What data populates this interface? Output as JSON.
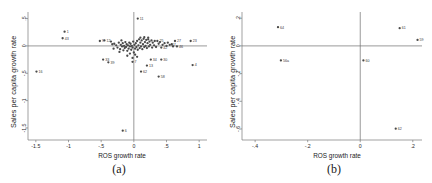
{
  "figure": {
    "panels": [
      {
        "id": "a",
        "caption": "(a)",
        "xlabel": "ROS growth rate",
        "ylabel": "Sales per capita growth rate"
      },
      {
        "id": "b",
        "caption": "(b)",
        "xlabel": "ROS growth rate",
        "ylabel": "Sales per capita growth rate"
      }
    ]
  },
  "chart_data": [
    {
      "type": "scatter",
      "panel": "a",
      "title": "(a)",
      "xlabel": "ROS growth rate",
      "ylabel": "Sales per capita growth rate",
      "xlim": [
        -1.62,
        1.12
      ],
      "ylim": [
        -1.72,
        0.62
      ],
      "xticks": [
        -1.5,
        -1,
        -0.5,
        0,
        0.5,
        1
      ],
      "xticklabels": [
        "-1.5",
        "-1",
        "-.5",
        "0",
        ".5",
        "1"
      ],
      "yticks": [
        0.5,
        0,
        -0.5,
        -1,
        -1.5
      ],
      "yticklabels": [
        ".5",
        "0",
        "-.5",
        "-1",
        "-1.5"
      ],
      "grid": false,
      "legend": false,
      "zero_lines": true,
      "points": [
        {
          "label": "11",
          "x": 0.06,
          "y": 0.5
        },
        {
          "label": "1",
          "x": -1.06,
          "y": 0.26
        },
        {
          "label": "43",
          "x": -1.09,
          "y": 0.14
        },
        {
          "label": "16",
          "x": -1.49,
          "y": -0.47
        },
        {
          "label": "12",
          "x": -0.45,
          "y": 0.1
        },
        {
          "label": "9",
          "x": -0.52,
          "y": 0.09
        },
        {
          "label": "25",
          "x": 0.36,
          "y": 0.09
        },
        {
          "label": "27",
          "x": 0.63,
          "y": 0.09
        },
        {
          "label": "23",
          "x": 0.87,
          "y": 0.09
        },
        {
          "label": "47",
          "x": 0.55,
          "y": 0.02
        },
        {
          "label": "46",
          "x": 0.66,
          "y": -0.01
        },
        {
          "label": "42",
          "x": 0.42,
          "y": -0.03
        },
        {
          "label": "33",
          "x": -0.47,
          "y": -0.25
        },
        {
          "label": "39",
          "x": -0.39,
          "y": -0.3
        },
        {
          "label": "7",
          "x": -0.02,
          "y": -0.29
        },
        {
          "label": "34",
          "x": 0.26,
          "y": -0.25
        },
        {
          "label": "30",
          "x": 0.42,
          "y": -0.25
        },
        {
          "label": "13",
          "x": 0.2,
          "y": -0.36
        },
        {
          "label": "4",
          "x": 0.9,
          "y": -0.35
        },
        {
          "label": "62",
          "x": 0.11,
          "y": -0.47
        },
        {
          "label": "58",
          "x": 0.38,
          "y": -0.56
        },
        {
          "label": "6",
          "x": -0.17,
          "y": -1.55
        },
        {
          "label": "",
          "x": -0.3,
          "y": 0.04
        },
        {
          "label": "",
          "x": -0.27,
          "y": 0.01
        },
        {
          "label": "",
          "x": -0.25,
          "y": -0.03
        },
        {
          "label": "",
          "x": -0.23,
          "y": 0.06
        },
        {
          "label": "",
          "x": -0.21,
          "y": -0.06
        },
        {
          "label": "",
          "x": -0.2,
          "y": 0.02
        },
        {
          "label": "",
          "x": -0.18,
          "y": -0.01
        },
        {
          "label": "",
          "x": -0.17,
          "y": 0.05
        },
        {
          "label": "",
          "x": -0.16,
          "y": -0.08
        },
        {
          "label": "",
          "x": -0.15,
          "y": 0.0
        },
        {
          "label": "",
          "x": -0.14,
          "y": -0.04
        },
        {
          "label": "",
          "x": -0.13,
          "y": 0.07
        },
        {
          "label": "",
          "x": -0.12,
          "y": -0.02
        },
        {
          "label": "",
          "x": -0.11,
          "y": 0.03
        },
        {
          "label": "",
          "x": -0.1,
          "y": -0.09
        },
        {
          "label": "",
          "x": -0.09,
          "y": 0.01
        },
        {
          "label": "",
          "x": -0.08,
          "y": -0.05
        },
        {
          "label": "",
          "x": -0.07,
          "y": 0.06
        },
        {
          "label": "",
          "x": -0.06,
          "y": -0.01
        },
        {
          "label": "",
          "x": -0.05,
          "y": 0.04
        },
        {
          "label": "",
          "x": -0.04,
          "y": -0.07
        },
        {
          "label": "",
          "x": -0.03,
          "y": 0.0
        },
        {
          "label": "",
          "x": -0.02,
          "y": -0.03
        },
        {
          "label": "",
          "x": -0.01,
          "y": 0.08
        },
        {
          "label": "",
          "x": 0.0,
          "y": -0.12
        },
        {
          "label": "",
          "x": 0.01,
          "y": 0.02
        },
        {
          "label": "",
          "x": 0.02,
          "y": -0.05
        },
        {
          "label": "",
          "x": 0.03,
          "y": 0.05
        },
        {
          "label": "",
          "x": 0.04,
          "y": -0.02
        },
        {
          "label": "",
          "x": 0.05,
          "y": 0.09
        },
        {
          "label": "",
          "x": 0.06,
          "y": -0.07
        },
        {
          "label": "",
          "x": 0.07,
          "y": 0.01
        },
        {
          "label": "",
          "x": 0.08,
          "y": 0.12
        },
        {
          "label": "",
          "x": 0.09,
          "y": -0.04
        },
        {
          "label": "",
          "x": 0.1,
          "y": 0.06
        },
        {
          "label": "",
          "x": 0.11,
          "y": -0.01
        },
        {
          "label": "",
          "x": 0.12,
          "y": 0.1
        },
        {
          "label": "",
          "x": 0.13,
          "y": -0.06
        },
        {
          "label": "",
          "x": 0.14,
          "y": 0.03
        },
        {
          "label": "",
          "x": 0.15,
          "y": 0.13
        },
        {
          "label": "",
          "x": 0.16,
          "y": -0.02
        },
        {
          "label": "",
          "x": 0.17,
          "y": 0.07
        },
        {
          "label": "",
          "x": 0.18,
          "y": 0.0
        },
        {
          "label": "",
          "x": 0.19,
          "y": 0.11
        },
        {
          "label": "",
          "x": 0.2,
          "y": -0.04
        },
        {
          "label": "",
          "x": 0.21,
          "y": 0.05
        },
        {
          "label": "",
          "x": 0.22,
          "y": 0.12
        },
        {
          "label": "",
          "x": 0.23,
          "y": -0.01
        },
        {
          "label": "",
          "x": 0.24,
          "y": 0.08
        },
        {
          "label": "",
          "x": 0.25,
          "y": 0.02
        },
        {
          "label": "",
          "x": 0.27,
          "y": 0.1
        },
        {
          "label": "",
          "x": 0.28,
          "y": -0.03
        },
        {
          "label": "",
          "x": 0.29,
          "y": 0.06
        },
        {
          "label": "",
          "x": 0.31,
          "y": 0.01
        },
        {
          "label": "",
          "x": 0.32,
          "y": 0.09
        },
        {
          "label": "",
          "x": 0.34,
          "y": -0.02
        },
        {
          "label": "",
          "x": 0.38,
          "y": 0.04
        },
        {
          "label": "",
          "x": 0.4,
          "y": 0.07
        },
        {
          "label": "",
          "x": 0.44,
          "y": 0.02
        },
        {
          "label": "",
          "x": 0.47,
          "y": 0.05
        },
        {
          "label": "",
          "x": 0.5,
          "y": 0.0
        },
        {
          "label": "",
          "x": 0.52,
          "y": 0.06
        },
        {
          "label": "",
          "x": 0.58,
          "y": 0.03
        },
        {
          "label": "",
          "x": 0.6,
          "y": -0.01
        },
        {
          "label": "",
          "x": -0.35,
          "y": 0.08
        },
        {
          "label": "",
          "x": -0.33,
          "y": 0.03
        },
        {
          "label": "",
          "x": -0.31,
          "y": -0.05
        },
        {
          "label": "",
          "x": -0.19,
          "y": 0.1
        },
        {
          "label": "",
          "x": -0.22,
          "y": -0.11
        },
        {
          "label": "",
          "x": -0.06,
          "y": -0.14
        },
        {
          "label": "",
          "x": 0.02,
          "y": -0.16
        },
        {
          "label": "",
          "x": -0.1,
          "y": -0.18
        },
        {
          "label": "",
          "x": 0.05,
          "y": -0.2
        },
        {
          "label": "",
          "x": -0.02,
          "y": -0.22
        },
        {
          "label": "",
          "x": 0.16,
          "y": 0.16
        },
        {
          "label": "",
          "x": 0.22,
          "y": 0.15
        },
        {
          "label": "",
          "x": 0.1,
          "y": 0.15
        }
      ]
    },
    {
      "type": "scatter",
      "panel": "b",
      "title": "(b)",
      "xlabel": "ROS growth rate",
      "ylabel": "Sales per capita growth rate",
      "xlim": [
        -0.45,
        0.235
      ],
      "ylim": [
        -0.68,
        0.245
      ],
      "xticks": [
        -0.4,
        -0.2,
        0,
        0.2
      ],
      "xticklabels": [
        "-.4",
        "-.2",
        "0",
        ".2"
      ],
      "yticks": [
        0.2,
        0,
        -0.2,
        -0.4,
        -0.6
      ],
      "yticklabels": [
        ".2",
        "0",
        "-.2",
        "-.4",
        "-.6"
      ],
      "grid": false,
      "legend": false,
      "zero_lines": true,
      "points": [
        {
          "label": "64",
          "x": -0.313,
          "y": 0.135
        },
        {
          "label": "61",
          "x": 0.15,
          "y": 0.128
        },
        {
          "label": "59",
          "x": 0.218,
          "y": 0.043
        },
        {
          "label": "56a",
          "x": -0.302,
          "y": -0.105
        },
        {
          "label": "60",
          "x": 0.012,
          "y": -0.105
        },
        {
          "label": "62",
          "x": 0.135,
          "y": -0.598
        }
      ]
    }
  ]
}
